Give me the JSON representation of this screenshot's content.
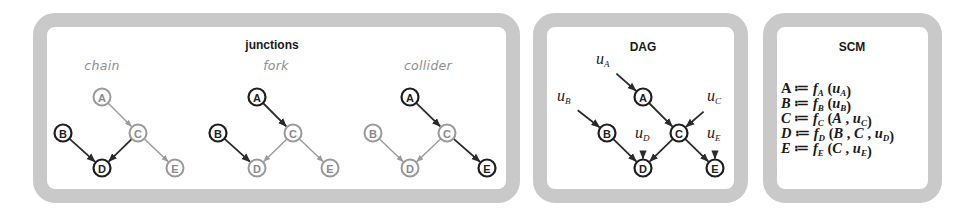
{
  "panels": {
    "junctions": {
      "title": "junctions",
      "subpanels": [
        {
          "label": "chain",
          "offset_x": 0,
          "nodes": [
            {
              "id": "A",
              "x": 102,
              "y": 97,
              "style": "light"
            },
            {
              "id": "B",
              "x": 63,
              "y": 133,
              "style": "dark"
            },
            {
              "id": "C",
              "x": 138,
              "y": 133,
              "style": "light"
            },
            {
              "id": "D",
              "x": 102,
              "y": 168,
              "style": "dark"
            },
            {
              "id": "E",
              "x": 175,
              "y": 168,
              "style": "light"
            }
          ],
          "edges": [
            {
              "from": "A",
              "to": "C",
              "style": "light"
            },
            {
              "from": "B",
              "to": "D",
              "style": "dark"
            },
            {
              "from": "C",
              "to": "D",
              "style": "dark"
            },
            {
              "from": "C",
              "to": "E",
              "style": "light"
            }
          ]
        },
        {
          "label": "fork",
          "nodes": [
            {
              "id": "A",
              "x": 257,
              "y": 97,
              "style": "dark"
            },
            {
              "id": "B",
              "x": 218,
              "y": 133,
              "style": "dark"
            },
            {
              "id": "C",
              "x": 293,
              "y": 133,
              "style": "light"
            },
            {
              "id": "D",
              "x": 257,
              "y": 168,
              "style": "light"
            },
            {
              "id": "E",
              "x": 330,
              "y": 168,
              "style": "light"
            }
          ],
          "edges": [
            {
              "from": "A",
              "to": "C",
              "style": "dark"
            },
            {
              "from": "B",
              "to": "D",
              "style": "dark"
            },
            {
              "from": "C",
              "to": "D",
              "style": "light"
            },
            {
              "from": "C",
              "to": "E",
              "style": "light"
            }
          ]
        },
        {
          "label": "collider",
          "nodes": [
            {
              "id": "A",
              "x": 410,
              "y": 97,
              "style": "dark"
            },
            {
              "id": "B",
              "x": 373,
              "y": 133,
              "style": "light"
            },
            {
              "id": "C",
              "x": 447,
              "y": 133,
              "style": "light"
            },
            {
              "id": "D",
              "x": 410,
              "y": 168,
              "style": "light"
            },
            {
              "id": "E",
              "x": 487,
              "y": 168,
              "style": "dark"
            }
          ],
          "edges": [
            {
              "from": "A",
              "to": "C",
              "style": "dark"
            },
            {
              "from": "B",
              "to": "D",
              "style": "light"
            },
            {
              "from": "C",
              "to": "D",
              "style": "light"
            },
            {
              "from": "C",
              "to": "E",
              "style": "dark"
            }
          ]
        }
      ]
    },
    "dag": {
      "title": "DAG",
      "nodes": [
        {
          "id": "A",
          "x": 643,
          "y": 97
        },
        {
          "id": "B",
          "x": 607,
          "y": 133
        },
        {
          "id": "C",
          "x": 679,
          "y": 133
        },
        {
          "id": "D",
          "x": 643,
          "y": 168
        },
        {
          "id": "E",
          "x": 715,
          "y": 168
        }
      ],
      "edges": [
        {
          "from": "A",
          "to": "C"
        },
        {
          "from": "B",
          "to": "D"
        },
        {
          "from": "C",
          "to": "D"
        },
        {
          "from": "C",
          "to": "E"
        }
      ],
      "noise": [
        {
          "label": "u",
          "sub": "A",
          "target": "A",
          "x": 596,
          "y": 64
        },
        {
          "label": "u",
          "sub": "B",
          "target": "B",
          "x": 557,
          "y": 101
        },
        {
          "label": "u",
          "sub": "C",
          "target": "C",
          "x": 707,
          "y": 101
        },
        {
          "label": "u",
          "sub": "D",
          "target": "D",
          "x": 635,
          "y": 138
        },
        {
          "label": "u",
          "sub": "E",
          "target": "E",
          "x": 707,
          "y": 138
        }
      ]
    },
    "scm": {
      "title": "SCM",
      "equations": [
        {
          "lhs": "A",
          "lhs_italic": false,
          "fn": "f",
          "fn_sub": "A",
          "args": [
            {
              "t": "u",
              "sub": "A"
            }
          ]
        },
        {
          "lhs": "B",
          "lhs_italic": true,
          "fn": "f",
          "fn_sub": "B",
          "args": [
            {
              "t": "u",
              "sub": "B"
            }
          ]
        },
        {
          "lhs": "C",
          "lhs_italic": true,
          "fn": "f",
          "fn_sub": "C",
          "args": [
            {
              "t": "A"
            },
            {
              "t": "u",
              "sub": "C"
            }
          ]
        },
        {
          "lhs": "D",
          "lhs_italic": true,
          "fn": "f",
          "fn_sub": "D",
          "args": [
            {
              "t": "B"
            },
            {
              "t": "C"
            },
            {
              "t": "u",
              "sub": "D"
            }
          ]
        },
        {
          "lhs": "E",
          "lhs_italic": true,
          "fn": "f",
          "fn_sub": "E",
          "args": [
            {
              "t": "C"
            },
            {
              "t": "u",
              "sub": "E"
            }
          ]
        }
      ],
      "assign_symbol": "≔"
    }
  },
  "colors": {
    "panel_border": "#c9c9c9",
    "dark": "#1e1e1e",
    "light": "#9a9a9a",
    "subtitle": "#8e8e8e"
  }
}
